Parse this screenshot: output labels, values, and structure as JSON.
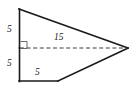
{
  "figure": {
    "kind": "geometry-diagram",
    "shape": "quadrilateral-kite",
    "background_color": "#ffffff",
    "stroke_color": "#1a1a1a",
    "dashed_stroke_color": "#3a3a3a",
    "right_angle_color": "#5a5a5a",
    "vertices": {
      "top_left": [
        19,
        9
      ],
      "left_midpoint": [
        20,
        48
      ],
      "bottom_left": [
        19,
        81
      ],
      "bottom_mid": [
        58,
        81
      ],
      "apex_right": [
        128,
        48
      ]
    },
    "edges": [
      {
        "name": "left-vertical-upper",
        "from": [
          19,
          9
        ],
        "to": [
          19,
          48
        ],
        "style": "solid"
      },
      {
        "name": "left-vertical-lower",
        "from": [
          19,
          48
        ],
        "to": [
          19,
          81
        ],
        "style": "solid"
      },
      {
        "name": "bottom-horizontal",
        "from": [
          19,
          81
        ],
        "to": [
          58,
          81
        ],
        "style": "solid"
      },
      {
        "name": "bottom-diagonal",
        "from": [
          58,
          81
        ],
        "to": [
          128,
          48
        ],
        "style": "solid"
      },
      {
        "name": "top-diagonal",
        "from": [
          19,
          9
        ],
        "to": [
          128,
          48
        ],
        "style": "solid"
      }
    ],
    "dashed_segment": {
      "name": "horizontal-diagonal",
      "from": [
        20,
        48
      ],
      "to": [
        128,
        48
      ]
    },
    "right_angle_marker": {
      "x": 20,
      "y": 41,
      "size": 7
    },
    "labels": {
      "left_upper": "5",
      "left_lower": "5",
      "bottom": "5",
      "diagonal": "15"
    }
  }
}
